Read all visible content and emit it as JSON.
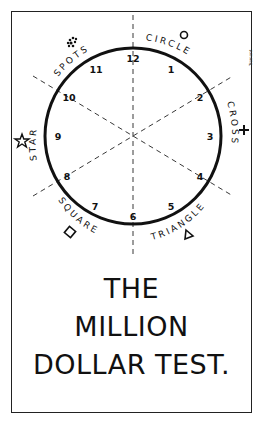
{
  "card": {
    "title_lines": [
      "THE",
      "MILLION",
      "DOLLAR TEST."
    ],
    "signature": "Tremont"
  },
  "dial": {
    "numbers": [
      "12",
      "1",
      "2",
      "3",
      "4",
      "5",
      "6",
      "7",
      "8",
      "9",
      "10",
      "11"
    ],
    "sectors": [
      {
        "label": "CIRCLE",
        "symbol": "circle",
        "glyph": "○"
      },
      {
        "label": "CROSS",
        "symbol": "cross",
        "glyph": "+"
      },
      {
        "label": "TRIANGLE",
        "symbol": "triangle",
        "glyph": "△"
      },
      {
        "label": "SQUARE",
        "symbol": "square",
        "glyph": "◇"
      },
      {
        "label": "STAR",
        "symbol": "star",
        "glyph": "☆"
      },
      {
        "label": "SPOTS",
        "symbol": "spots",
        "glyph": "⁘"
      }
    ]
  },
  "colors": {
    "ink": "#111111",
    "paper": "#ffffff"
  }
}
